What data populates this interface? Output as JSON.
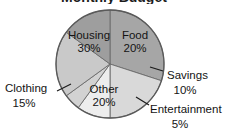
{
  "figure": {
    "title_partial": "Monthly Budget",
    "title_visible": "cropped-off at top edge, only letter bottoms visible",
    "background_color": "#ffffff"
  },
  "chart_data": {
    "type": "pie",
    "title": "Monthly Budget",
    "xlabel": "",
    "ylabel": "",
    "legend_position": "none",
    "grid": false,
    "categories": [
      "Housing",
      "Food",
      "Savings",
      "Entertainment",
      "Other",
      "Clothing"
    ],
    "values": [
      30,
      20,
      10,
      5,
      20,
      15
    ],
    "unit": "%",
    "start_angle_deg": 0,
    "direction": "clockwise",
    "slices": [
      {
        "name": "Housing",
        "value": 30,
        "label": "Housing",
        "value_label": "30%",
        "color": "#a6a6a6",
        "label_placement": "inside",
        "label_x": 89,
        "label_y": 36,
        "value_x": 89,
        "value_y": 49
      },
      {
        "name": "Food",
        "value": 20,
        "label": "Food",
        "value_label": "20%",
        "color": "#d9d9d9",
        "label_placement": "inside",
        "label_x": 135,
        "label_y": 36,
        "value_x": 135,
        "value_y": 49
      },
      {
        "name": "Savings",
        "value": 10,
        "label": "Savings",
        "value_label": "10%",
        "color": "#ededed",
        "label_placement": "outside",
        "label_x": 167,
        "label_y": 76,
        "value_x": 185,
        "value_y": 91,
        "leader": "M 150 67 L 163 71"
      },
      {
        "name": "Entertainment",
        "value": 5,
        "label": "Entertainment",
        "value_label": "5%",
        "color": "#d2d2d2",
        "label_placement": "outside",
        "label_x": 150,
        "label_y": 110,
        "value_x": 180,
        "value_y": 125,
        "leader": "M 136 97 L 149 105"
      },
      {
        "name": "Other",
        "value": 20,
        "label": "Other",
        "value_label": "20%",
        "color": "#c9c9c9",
        "label_placement": "inside",
        "label_x": 104,
        "label_y": 90,
        "value_x": 104,
        "value_y": 103
      },
      {
        "name": "Clothing",
        "value": 15,
        "label": "Clothing",
        "value_label": "15%",
        "color": "#9e9e9e",
        "label_placement": "outside",
        "label_x": 5,
        "label_y": 89,
        "value_x": 24,
        "value_y": 104,
        "leader": "M 71 84 L 57 91"
      }
    ],
    "geometry": {
      "center_x": 110,
      "center_y": 64,
      "radius": 54
    }
  }
}
